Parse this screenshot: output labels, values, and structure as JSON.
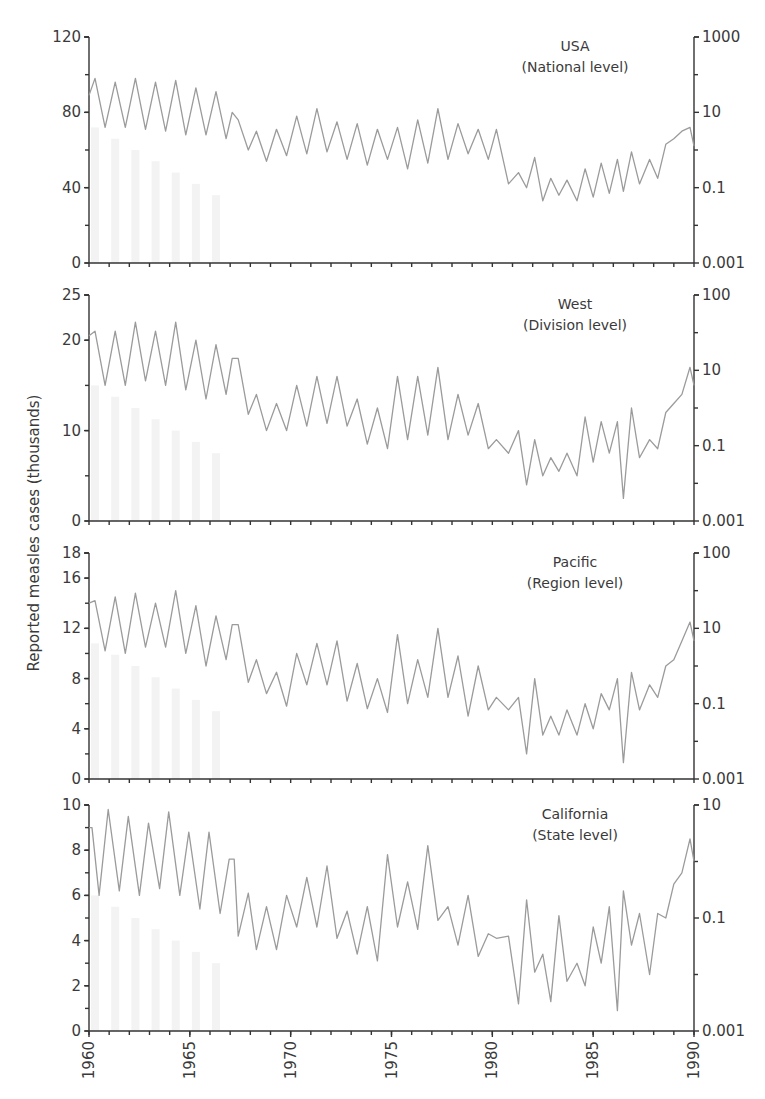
{
  "chart_data": {
    "type": "line",
    "title": "",
    "ylabel": "Reported measles cases (thousands)",
    "xlabel": "",
    "x_range": [
      1960,
      1990
    ],
    "x_ticks": [
      "1960",
      "1965",
      "1970",
      "1975",
      "1980",
      "1985",
      "1990"
    ],
    "line_color": "#9b9b9b",
    "panels": [
      {
        "name": "USA",
        "subtitle": "(National level)",
        "left_ylim": [
          0,
          120
        ],
        "left_ticks": [
          "0",
          "40",
          "80",
          "120"
        ],
        "right_ticks": [
          "0.001",
          "0.1",
          "10",
          "1000"
        ],
        "x": [
          1960,
          1960.3,
          1960.8,
          1961.3,
          1961.8,
          1962.3,
          1962.8,
          1963.3,
          1963.8,
          1964.3,
          1964.8,
          1965.3,
          1965.8,
          1966.3,
          1966.8,
          1967.1,
          1967.4,
          1967.9,
          1968.3,
          1968.8,
          1969.3,
          1969.8,
          1970.3,
          1970.8,
          1971.3,
          1971.8,
          1972.3,
          1972.8,
          1973.3,
          1973.8,
          1974.3,
          1974.8,
          1975.3,
          1975.8,
          1976.3,
          1976.8,
          1977.3,
          1977.8,
          1978.3,
          1978.8,
          1979.3,
          1979.8,
          1980.2,
          1980.8,
          1981.3,
          1981.7,
          1982.1,
          1982.5,
          1982.9,
          1983.3,
          1983.7,
          1984.2,
          1984.6,
          1985.0,
          1985.4,
          1985.8,
          1986.2,
          1986.5,
          1986.9,
          1987.3,
          1987.8,
          1988.2,
          1988.6,
          1989.0,
          1989.4,
          1989.8,
          1990
        ],
        "values": [
          89,
          98,
          72,
          96,
          72,
          98,
          71,
          96,
          70,
          97,
          68,
          93,
          68,
          91,
          66,
          80,
          76,
          60,
          70,
          54,
          71,
          57,
          78,
          58,
          82,
          59,
          75,
          55,
          74,
          52,
          71,
          55,
          72,
          50,
          76,
          53,
          82,
          55,
          74,
          58,
          71,
          55,
          71,
          42,
          48,
          40,
          56,
          33,
          45,
          36,
          44,
          33,
          50,
          35,
          53,
          37,
          55,
          38,
          59,
          42,
          55,
          45,
          63,
          66,
          70,
          72,
          62
        ]
      },
      {
        "name": "West",
        "subtitle": "(Division level)",
        "left_ylim": [
          0,
          25
        ],
        "left_ticks": [
          "0",
          "10",
          "20",
          "25"
        ],
        "right_ticks": [
          "0.001",
          "0.1",
          "10",
          "100"
        ],
        "x": [
          1960,
          1960.3,
          1960.8,
          1961.3,
          1961.8,
          1962.3,
          1962.8,
          1963.3,
          1963.8,
          1964.3,
          1964.8,
          1965.3,
          1965.8,
          1966.3,
          1966.8,
          1967.1,
          1967.4,
          1967.9,
          1968.3,
          1968.8,
          1969.3,
          1969.8,
          1970.3,
          1970.8,
          1971.3,
          1971.8,
          1972.3,
          1972.8,
          1973.3,
          1973.8,
          1974.3,
          1974.8,
          1975.3,
          1975.8,
          1976.3,
          1976.8,
          1977.3,
          1977.8,
          1978.3,
          1978.8,
          1979.3,
          1979.8,
          1980.2,
          1980.8,
          1981.3,
          1981.7,
          1982.1,
          1982.5,
          1982.9,
          1983.3,
          1983.7,
          1984.2,
          1984.6,
          1985.0,
          1985.4,
          1985.8,
          1986.2,
          1986.5,
          1986.9,
          1987.3,
          1987.8,
          1988.2,
          1988.6,
          1989.0,
          1989.4,
          1989.8,
          1990
        ],
        "values": [
          20.5,
          21,
          15,
          21,
          15,
          22,
          15.5,
          21,
          15,
          22,
          14.5,
          20,
          13.5,
          19.5,
          14,
          18,
          18,
          11.8,
          14,
          10,
          13,
          10,
          15,
          10.5,
          16,
          10.8,
          16,
          10.5,
          13.5,
          8.5,
          12.5,
          8,
          16,
          9,
          16,
          9.5,
          17,
          9,
          14,
          9.5,
          13,
          8,
          9,
          7.5,
          10,
          4,
          9,
          5,
          7,
          5.5,
          7.5,
          5,
          11.5,
          6.5,
          11,
          7.5,
          11,
          2.5,
          12.5,
          7,
          9,
          8,
          12,
          13,
          14,
          17,
          15
        ]
      },
      {
        "name": "Pacific",
        "subtitle": "(Region level)",
        "left_ylim": [
          0,
          18
        ],
        "left_ticks": [
          "0",
          "4",
          "8",
          "12",
          "16",
          "18"
        ],
        "right_ticks": [
          "0.001",
          "0.1",
          "10",
          "100"
        ],
        "x": [
          1960,
          1960.3,
          1960.8,
          1961.3,
          1961.8,
          1962.3,
          1962.8,
          1963.3,
          1963.8,
          1964.3,
          1964.8,
          1965.3,
          1965.8,
          1966.3,
          1966.8,
          1967.1,
          1967.4,
          1967.9,
          1968.3,
          1968.8,
          1969.3,
          1969.8,
          1970.3,
          1970.8,
          1971.3,
          1971.8,
          1972.3,
          1972.8,
          1973.3,
          1973.8,
          1974.3,
          1974.8,
          1975.3,
          1975.8,
          1976.3,
          1976.8,
          1977.3,
          1977.8,
          1978.3,
          1978.8,
          1979.3,
          1979.8,
          1980.2,
          1980.8,
          1981.3,
          1981.7,
          1982.1,
          1982.5,
          1982.9,
          1983.3,
          1983.7,
          1984.2,
          1984.6,
          1985.0,
          1985.4,
          1985.8,
          1986.2,
          1986.5,
          1986.9,
          1987.3,
          1987.8,
          1988.2,
          1988.6,
          1989.0,
          1989.4,
          1989.8,
          1990
        ],
        "values": [
          14,
          14.2,
          10.2,
          14.5,
          10,
          14.8,
          10.5,
          14,
          10.5,
          15,
          10,
          13.8,
          9,
          13,
          9.5,
          12.3,
          12.3,
          7.7,
          9.5,
          6.8,
          8.5,
          5.8,
          10,
          7.5,
          10.8,
          7.5,
          11,
          6.2,
          9.2,
          5.6,
          8,
          5.3,
          11.5,
          6,
          9.5,
          6.5,
          12,
          6.5,
          9.8,
          5,
          9,
          5.5,
          6.5,
          5.5,
          6.5,
          2,
          8,
          3.5,
          5,
          3.5,
          5.5,
          3.5,
          6,
          4,
          6.8,
          5.5,
          8,
          1.3,
          8.5,
          5.5,
          7.5,
          6.5,
          9,
          9.5,
          11,
          12.5,
          11
        ]
      },
      {
        "name": "California",
        "subtitle": "(State level)",
        "left_ylim": [
          0,
          10
        ],
        "left_ticks": [
          "0",
          "2",
          "4",
          "6",
          "8",
          "10"
        ],
        "right_ticks": [
          "0.001",
          "0.1",
          "10"
        ],
        "x": [
          1960,
          1960.15,
          1960.5,
          1960.95,
          1961.5,
          1961.95,
          1962.5,
          1962.95,
          1963.5,
          1963.95,
          1964.5,
          1964.95,
          1965.5,
          1965.95,
          1966.5,
          1966.95,
          1967.2,
          1967.4,
          1967.9,
          1968.3,
          1968.8,
          1969.3,
          1969.8,
          1970.3,
          1970.8,
          1971.3,
          1971.8,
          1972.3,
          1972.8,
          1973.3,
          1973.8,
          1974.3,
          1974.8,
          1975.3,
          1975.8,
          1976.3,
          1976.8,
          1977.3,
          1977.8,
          1978.3,
          1978.8,
          1979.3,
          1979.8,
          1980.2,
          1980.8,
          1981.3,
          1981.7,
          1982.1,
          1982.5,
          1982.9,
          1983.3,
          1983.7,
          1984.2,
          1984.6,
          1985.0,
          1985.4,
          1985.8,
          1986.2,
          1986.5,
          1986.9,
          1987.3,
          1987.8,
          1988.2,
          1988.6,
          1989.0,
          1989.4,
          1989.8,
          1990
        ],
        "values": [
          9,
          9,
          6,
          9.8,
          6.2,
          9.5,
          6,
          9.2,
          6.3,
          9.7,
          6,
          8.8,
          5.4,
          8.8,
          5.2,
          7.6,
          7.6,
          4.2,
          6.1,
          3.6,
          5.5,
          3.6,
          6,
          4.6,
          6.8,
          4.6,
          7.3,
          4.1,
          5.3,
          3.4,
          5.5,
          3.1,
          7.8,
          4.6,
          6.6,
          4.5,
          8.2,
          4.9,
          5.5,
          3.8,
          6,
          3.3,
          4.3,
          4.1,
          4.2,
          1.2,
          5.8,
          2.6,
          3.4,
          1.3,
          5.1,
          2.2,
          3,
          2,
          4.6,
          3,
          5.5,
          0.9,
          6.2,
          3.8,
          5.2,
          2.5,
          5.2,
          5,
          6.5,
          7,
          8.5,
          7.5
        ]
      }
    ]
  }
}
